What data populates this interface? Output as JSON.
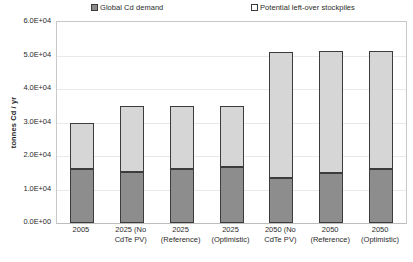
{
  "chart_data": {
    "type": "bar",
    "subtype": "stacked-column",
    "title": "",
    "xlabel": "",
    "ylabel": "tonnes Cd / yr",
    "ylim": [
      0,
      60000
    ],
    "yticks": [
      "0.0E+00",
      "1.0E+04",
      "2.0E+04",
      "3.0E+04",
      "4.0E+04",
      "5.0E+04",
      "6.0E+04"
    ],
    "ytick_values": [
      0,
      10000,
      20000,
      30000,
      40000,
      50000,
      60000
    ],
    "grid": true,
    "legend_position": "top",
    "categories": [
      "2005",
      "2025 (No CdTe PV)",
      "2025 (Reference)",
      "2025 (Optimistic)",
      "2050 (No CdTe PV)",
      "2050 (Reference)",
      "2050 (Optimistic)"
    ],
    "category_lines": [
      [
        "2005"
      ],
      [
        "2025 (No",
        "CdTe PV)"
      ],
      [
        "2025",
        "(Reference)"
      ],
      [
        "2025",
        "(Optimistic)"
      ],
      [
        "2050 (No",
        "CdTe PV)"
      ],
      [
        "2050",
        "(Reference)"
      ],
      [
        "2050",
        "(Optimistic)"
      ]
    ],
    "series": [
      {
        "name": "Global Cd demand",
        "color": "#8d8d8d",
        "swatch": "filled",
        "values": [
          16000,
          15200,
          16000,
          16800,
          13500,
          15000,
          16200
        ]
      },
      {
        "name": "Potential left-over stockpiles",
        "color": "#d6d6d6",
        "swatch": "hollow",
        "values": [
          14000,
          19800,
          19000,
          18200,
          37700,
          36200,
          35000
        ]
      }
    ],
    "totals": [
      30000,
      35000,
      35000,
      35000,
      51200,
      51200,
      51200
    ]
  },
  "legend": {
    "entries": [
      {
        "label": "Global Cd demand",
        "swatch": "filled"
      },
      {
        "label": "Potential left-over stockpiles",
        "swatch": "hollow"
      }
    ]
  },
  "axes": {
    "y_title": "tonnes Cd / yr"
  }
}
